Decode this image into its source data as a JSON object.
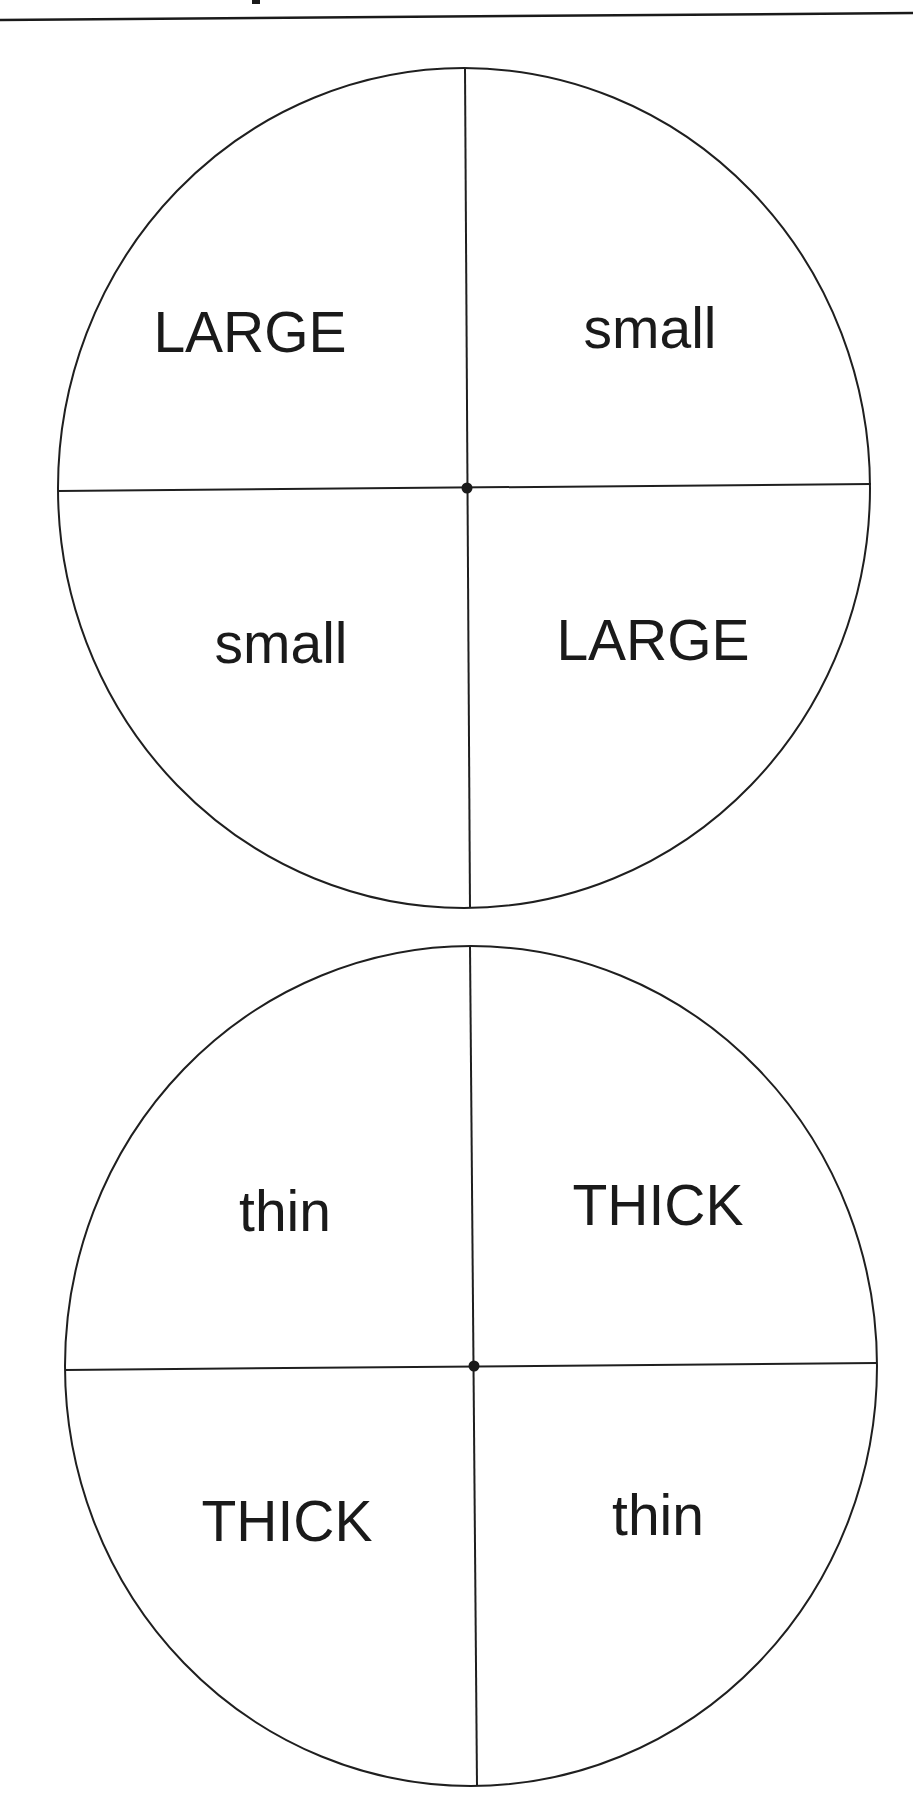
{
  "page": {
    "header_fragment": "·"
  },
  "spinners": [
    {
      "name": "size-spinner",
      "quadrants": {
        "top_left": "LARGE",
        "top_right": "small",
        "bottom_left": "small",
        "bottom_right": "LARGE"
      }
    },
    {
      "name": "thickness-spinner",
      "quadrants": {
        "top_left": "thin",
        "top_right": "THICK",
        "bottom_left": "THICK",
        "bottom_right": "thin"
      }
    }
  ],
  "colors": {
    "ink": "#1a1a1a",
    "paper": "#ffffff"
  }
}
